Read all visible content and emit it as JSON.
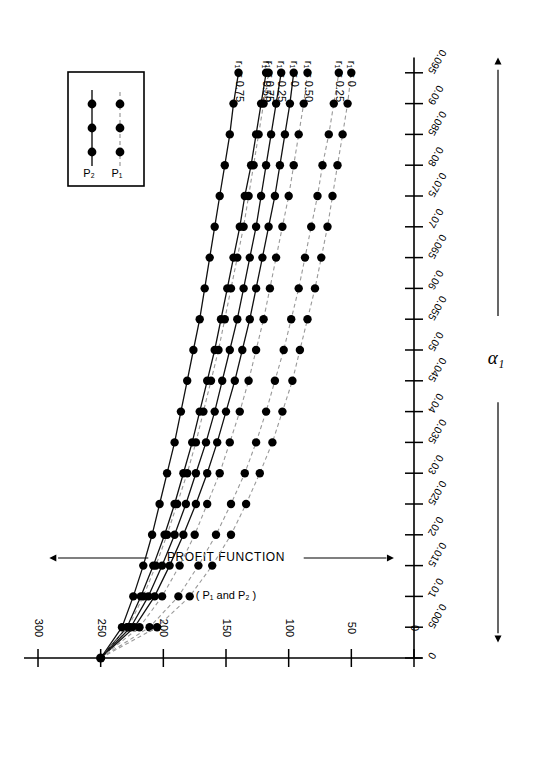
{
  "figure": {
    "orientation_deg": 180,
    "background": "#ffffff",
    "ink_color": "#000000",
    "p1_color": "#999999",
    "p2_color": "#111111"
  },
  "legend": {
    "entries": [
      {
        "label": "P₁",
        "style": "dashed",
        "marker": "filled-circle"
      },
      {
        "label": "P₂",
        "style": "solid",
        "marker": "filled-circle"
      }
    ]
  },
  "curve_labels": [
    "r₁ = 0.75",
    "r₁ = 0.50",
    "r₁ = 0.75",
    "r₁ = 0.25",
    "r₁ = 0",
    "r₁ = 0.50",
    "r₁ = 0.25",
    "r₁ = 0"
  ],
  "axis_titles": {
    "y_main": "PROFIT FUNCTION",
    "y_sub": "( P₁ and P₂ )",
    "x": "α₁"
  },
  "chart_data": {
    "type": "line",
    "title": "",
    "subtitle": "",
    "xlabel": "α₁",
    "ylabel": "PROFIT FUNCTION ( P₁ and P₂ )",
    "xlim": [
      0,
      0.0975
    ],
    "ylim": [
      0,
      300
    ],
    "grid": false,
    "legend_position": "top-left-inset",
    "xticks": [
      0,
      0.005,
      0.01,
      0.015,
      0.02,
      0.025,
      0.03,
      0.035,
      0.04,
      0.045,
      0.05,
      0.055,
      0.06,
      0.065,
      0.07,
      0.075,
      0.08,
      0.085,
      0.09,
      0.095
    ],
    "xticklabels": [
      "0",
      "0.005",
      "0.01",
      "0.015",
      "0.02",
      "0.025",
      "0.03",
      "0.035",
      "0.04",
      "0.045",
      "0.05",
      "0.055",
      "0.06",
      "0.065",
      "0.07",
      "0.075",
      "0.08",
      "0.085",
      "0.09",
      "0.095"
    ],
    "yticks": [
      0,
      50,
      100,
      150,
      200,
      250,
      300
    ],
    "yticklabels": [
      "0",
      "50",
      "100",
      "150",
      "200",
      "250",
      "300"
    ],
    "x": [
      0,
      0.005,
      0.01,
      0.015,
      0.02,
      0.025,
      0.03,
      0.035,
      0.04,
      0.045,
      0.05,
      0.055,
      0.06,
      0.065,
      0.07,
      0.075,
      0.08,
      0.085,
      0.09,
      0.095
    ],
    "series": [
      {
        "name": "P₂, r₁ = 0.75",
        "label": "r₁ = 0.75",
        "style": "solid",
        "r1": 0.75,
        "profit": "P2",
        "values": [
          250,
          233,
          224,
          216,
          209,
          203,
          197,
          191,
          186,
          181,
          176,
          171,
          167,
          163,
          159,
          155,
          151,
          147,
          144,
          140
        ]
      },
      {
        "name": "P₂, r₁ = 0.50",
        "label": "r₁ = 0.50",
        "style": "solid",
        "r1": 0.5,
        "profit": "P2",
        "values": [
          250,
          229,
          218,
          208,
          199,
          191,
          184,
          177,
          171,
          165,
          159,
          154,
          149,
          144,
          139,
          135,
          130,
          126,
          122,
          118
        ]
      },
      {
        "name": "P₁, r₁ = 0.75",
        "label": "r₁ = 0.75",
        "style": "dashed",
        "r1": 0.75,
        "profit": "P1",
        "values": [
          250,
          228,
          216,
          206,
          197,
          189,
          181,
          174,
          168,
          162,
          156,
          151,
          146,
          141,
          136,
          132,
          128,
          124,
          120,
          116
        ]
      },
      {
        "name": "P₂, r₁ = 0.25",
        "label": "r₁ = 0.25",
        "style": "solid",
        "r1": 0.25,
        "profit": "P2",
        "values": [
          250,
          226,
          212,
          201,
          191,
          182,
          174,
          166,
          159,
          153,
          147,
          141,
          136,
          131,
          126,
          122,
          118,
          114,
          110,
          106
        ]
      },
      {
        "name": "P₂, r₁ = 0",
        "label": "r₁ = 0",
        "style": "solid",
        "r1": 0,
        "profit": "P2",
        "values": [
          250,
          223,
          207,
          195,
          184,
          174,
          165,
          157,
          150,
          143,
          137,
          131,
          126,
          121,
          116,
          111,
          107,
          103,
          99,
          96
        ]
      },
      {
        "name": "P₁, r₁ = 0.50",
        "label": "r₁ = 0.50",
        "style": "dashed",
        "r1": 0.5,
        "profit": "P1",
        "values": [
          250,
          219,
          201,
          187,
          175,
          165,
          155,
          147,
          139,
          132,
          126,
          120,
          115,
          110,
          105,
          100,
          96,
          92,
          88,
          85
        ]
      },
      {
        "name": "P₁, r₁ = 0.25",
        "label": "r₁ = 0.25",
        "style": "dashed",
        "r1": 0.25,
        "profit": "P1",
        "values": [
          250,
          211,
          188,
          172,
          158,
          146,
          135,
          126,
          118,
          111,
          104,
          98,
          92,
          87,
          82,
          77,
          73,
          68,
          64,
          60
        ]
      },
      {
        "name": "P₁, r₁ = 0",
        "label": "r₁ = 0",
        "style": "dashed",
        "r1": 0,
        "profit": "P1",
        "values": [
          250,
          205,
          179,
          161,
          146,
          134,
          123,
          113,
          105,
          97,
          91,
          85,
          79,
          74,
          69,
          65,
          61,
          57,
          53,
          50
        ]
      }
    ]
  }
}
